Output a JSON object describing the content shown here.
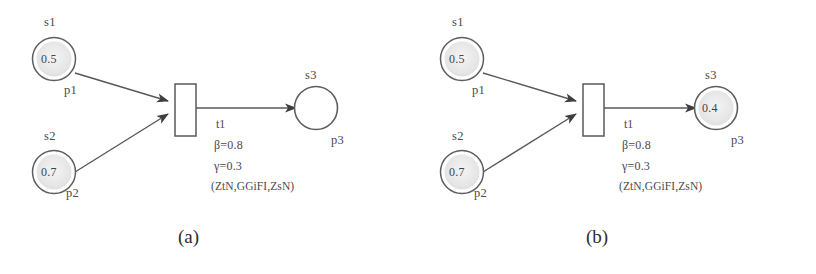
{
  "figure": {
    "type": "petri-net-pair",
    "stroke_color": "#5a5a5a",
    "token_fill": "#e8e8e8",
    "background": "#ffffff"
  },
  "panels": [
    {
      "caption": "(a)",
      "places": [
        {
          "name": "s1",
          "id": "p1",
          "token": "0.5",
          "has_token": true
        },
        {
          "name": "s2",
          "id": "p2",
          "token": "0.7",
          "has_token": true
        },
        {
          "name": "s3",
          "id": "p3",
          "token": "",
          "has_token": false
        }
      ],
      "transition": {
        "id": "t1",
        "beta": "β=0.8",
        "gamma": "γ=0.3",
        "tuple": "(ZtN,GGiFI,ZsN)"
      },
      "arcs": [
        {
          "from": "p1",
          "to": "t1"
        },
        {
          "from": "p2",
          "to": "t1"
        },
        {
          "from": "t1",
          "to": "p3"
        }
      ]
    },
    {
      "caption": "(b)",
      "places": [
        {
          "name": "s1",
          "id": "p1",
          "token": "0.5",
          "has_token": true
        },
        {
          "name": "s2",
          "id": "p2",
          "token": "0.7",
          "has_token": true
        },
        {
          "name": "s3",
          "id": "p3",
          "token": "0.4",
          "has_token": true
        }
      ],
      "transition": {
        "id": "t1",
        "beta": "β=0.8",
        "gamma": "γ=0.3",
        "tuple": "(ZtN,GGiFI,ZsN)"
      },
      "arcs": [
        {
          "from": "p1",
          "to": "t1"
        },
        {
          "from": "p2",
          "to": "t1"
        },
        {
          "from": "t1",
          "to": "p3"
        }
      ]
    }
  ]
}
